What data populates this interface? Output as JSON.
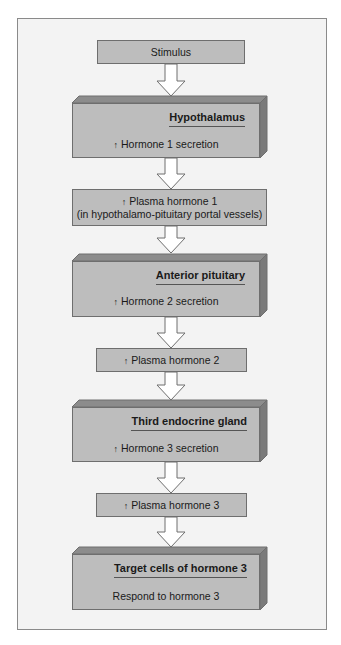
{
  "colors": {
    "frame_bg": "#f3f3f3",
    "box_fill": "#bdbdbd",
    "box_top": "#8c8c8c",
    "box_side": "#7a7a7a",
    "outline": "#6e6e6e"
  },
  "icons": {
    "increase": "up-arrow-icon"
  },
  "nodes": {
    "stimulus": {
      "label": "Stimulus"
    },
    "hypothalamus": {
      "title": "Hypothalamus",
      "up": "↑",
      "text": "Hormone 1 secretion"
    },
    "plasma1": {
      "up": "↑",
      "line1": "Plasma hormone 1",
      "line2": "(in hypothalamo-pituitary portal vessels)"
    },
    "anterior_pituitary": {
      "title": "Anterior pituitary",
      "up": "↑",
      "text": "Hormone 2 secretion"
    },
    "plasma2": {
      "up": "↑",
      "line1": "Plasma hormone 2"
    },
    "third_gland": {
      "title": "Third endocrine gland",
      "up": "↑",
      "text": "Hormone 3 secretion"
    },
    "plasma3": {
      "up": "↑",
      "line1": "Plasma hormone 3"
    },
    "target_cells": {
      "title": "Target cells of hormone 3",
      "text": "Respond to hormone 3"
    }
  }
}
